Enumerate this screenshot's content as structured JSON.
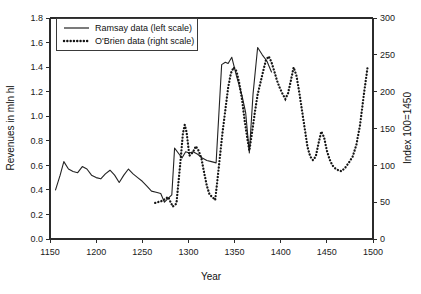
{
  "chart_data": {
    "type": "line",
    "title": "",
    "xlabel": "Year",
    "ylabel": "Revenues in mln hl",
    "ylabel_right": "Index 100=1450",
    "xlim": [
      1150,
      1500
    ],
    "ylim": [
      0.0,
      1.8
    ],
    "ylim_right": [
      0,
      300
    ],
    "grid": false,
    "legend_position": "top-left",
    "xticks": [
      1150,
      1200,
      1250,
      1300,
      1350,
      1400,
      1450,
      1500
    ],
    "xtick_labels": [
      "1150",
      "1200",
      "1250",
      "1300",
      "1350",
      "1400",
      "1450",
      "1500"
    ],
    "yticks": [
      0.0,
      0.2,
      0.4,
      0.6,
      0.8,
      1.0,
      1.2,
      1.4,
      1.6,
      1.8
    ],
    "ytick_labels": [
      "0.0",
      "0.2",
      "0.4",
      "0.6",
      "0.8",
      "1.0",
      "1.2",
      "1.4",
      "1.6",
      "1.8"
    ],
    "yticks_right": [
      0,
      50,
      100,
      150,
      200,
      250,
      300
    ],
    "ytick_labels_right": [
      "0",
      "50",
      "100",
      "150",
      "200",
      "250",
      "300"
    ],
    "series": [
      {
        "name": "Ramsay data (left scale)",
        "axis": "left",
        "style": "solid",
        "color": "#232323",
        "points": [
          [
            1156,
            0.4
          ],
          [
            1161,
            0.52
          ],
          [
            1165,
            0.63
          ],
          [
            1170,
            0.57
          ],
          [
            1175,
            0.55
          ],
          [
            1180,
            0.54
          ],
          [
            1185,
            0.59
          ],
          [
            1190,
            0.57
          ],
          [
            1195,
            0.52
          ],
          [
            1200,
            0.5
          ],
          [
            1205,
            0.49
          ],
          [
            1210,
            0.53
          ],
          [
            1215,
            0.56
          ],
          [
            1220,
            0.52
          ],
          [
            1225,
            0.46
          ],
          [
            1230,
            0.52
          ],
          [
            1235,
            0.57
          ],
          [
            1240,
            0.53
          ],
          [
            1245,
            0.5
          ],
          [
            1250,
            0.47
          ],
          [
            1255,
            0.43
          ],
          [
            1260,
            0.39
          ],
          [
            1265,
            0.38
          ],
          [
            1270,
            0.37
          ],
          [
            1274,
            0.3
          ],
          [
            1278,
            0.33
          ],
          [
            1282,
            0.36
          ],
          [
            1285,
            0.74
          ],
          [
            1290,
            0.69
          ],
          [
            1293,
            0.66
          ],
          [
            1297,
            0.71
          ],
          [
            1301,
            0.7
          ],
          [
            1305,
            0.71
          ],
          [
            1310,
            0.69
          ],
          [
            1315,
            0.66
          ],
          [
            1320,
            0.64
          ],
          [
            1325,
            0.63
          ],
          [
            1330,
            0.62
          ],
          [
            1336,
            1.42
          ],
          [
            1340,
            1.44
          ],
          [
            1343,
            1.43
          ],
          [
            1347,
            1.48
          ],
          [
            1352,
            1.33
          ],
          [
            1358,
            1.17
          ],
          [
            1362,
            1.03
          ],
          [
            1366,
            0.7
          ],
          [
            1370,
            1.18
          ],
          [
            1375,
            1.56
          ],
          [
            1380,
            1.5
          ],
          [
            1385,
            1.45
          ],
          [
            1390,
            1.36
          ]
        ]
      },
      {
        "name": "O'Brien data (right scale)",
        "axis": "right",
        "style": "dotted",
        "color": "#151515",
        "points": [
          [
            1264,
            49
          ],
          [
            1272,
            52
          ],
          [
            1278,
            57
          ],
          [
            1283,
            44
          ],
          [
            1287,
            48
          ],
          [
            1291,
            100
          ],
          [
            1294,
            143
          ],
          [
            1296,
            155
          ],
          [
            1298,
            145
          ],
          [
            1301,
            113
          ],
          [
            1305,
            118
          ],
          [
            1308,
            126
          ],
          [
            1311,
            120
          ],
          [
            1314,
            110
          ],
          [
            1317,
            90
          ],
          [
            1320,
            72
          ],
          [
            1323,
            60
          ],
          [
            1326,
            57
          ],
          [
            1329,
            53
          ],
          [
            1331,
            75
          ],
          [
            1334,
            110
          ],
          [
            1337,
            145
          ],
          [
            1340,
            175
          ],
          [
            1343,
            205
          ],
          [
            1346,
            225
          ],
          [
            1349,
            233
          ],
          [
            1352,
            228
          ],
          [
            1355,
            212
          ],
          [
            1358,
            190
          ],
          [
            1361,
            160
          ],
          [
            1364,
            135
          ],
          [
            1366,
            120
          ],
          [
            1369,
            145
          ],
          [
            1372,
            172
          ],
          [
            1375,
            196
          ],
          [
            1378,
            212
          ],
          [
            1381,
            228
          ],
          [
            1384,
            243
          ],
          [
            1387,
            248
          ],
          [
            1390,
            240
          ],
          [
            1393,
            228
          ],
          [
            1396,
            215
          ],
          [
            1399,
            205
          ],
          [
            1402,
            197
          ],
          [
            1405,
            190
          ],
          [
            1408,
            198
          ],
          [
            1411,
            215
          ],
          [
            1414,
            233
          ],
          [
            1417,
            222
          ],
          [
            1420,
            200
          ],
          [
            1423,
            175
          ],
          [
            1426,
            150
          ],
          [
            1429,
            125
          ],
          [
            1432,
            112
          ],
          [
            1435,
            107
          ],
          [
            1438,
            112
          ],
          [
            1441,
            130
          ],
          [
            1444,
            146
          ],
          [
            1447,
            138
          ],
          [
            1450,
            120
          ],
          [
            1453,
            108
          ],
          [
            1456,
            100
          ],
          [
            1459,
            96
          ],
          [
            1463,
            93
          ],
          [
            1466,
            92
          ],
          [
            1470,
            97
          ],
          [
            1474,
            104
          ],
          [
            1478,
            112
          ],
          [
            1482,
            128
          ],
          [
            1486,
            155
          ],
          [
            1490,
            195
          ],
          [
            1494,
            232
          ]
        ]
      }
    ]
  },
  "legend": {
    "entries": [
      {
        "label": "Ramsay data (left scale)",
        "marker": "solid-line-sample"
      },
      {
        "label": "O'Brien data (right scale)",
        "marker": "dotted-line-sample"
      }
    ]
  }
}
